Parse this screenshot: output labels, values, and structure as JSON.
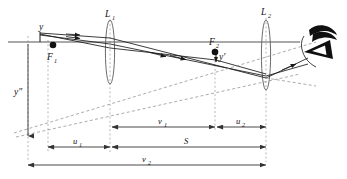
{
  "figure": {
    "type": "optical-ray-diagram",
    "title": "",
    "background_color": "#ffffff",
    "width": 347,
    "height": 179
  },
  "colors": {
    "ray": "#1a1a1a",
    "axis": "#555555",
    "lens_outline": "#6b6b6b",
    "dashed_guide": "#9a9a9a",
    "dimension": "#333333",
    "label": "#111111",
    "eye": "#101010"
  },
  "labels": {
    "lens1": "L",
    "lens1_sub": "1",
    "lens2": "L",
    "lens2_sub": "2",
    "focus1": "F",
    "focus1_sub": "1",
    "focus2": "F",
    "focus2_sub": "2",
    "object": "y",
    "image_prime": "y′",
    "image_double_prime": "y″",
    "dim_u1": "u",
    "dim_u1_sub": "1",
    "dim_u2": "u",
    "dim_u2_sub": "2",
    "dim_v1": "v",
    "dim_v1_sub": "1",
    "dim_v2": "v",
    "dim_v2_sub": "2",
    "dim_s": "S"
  },
  "elements": {
    "lenses": [
      {
        "name": "L1",
        "cx": 110,
        "cy": 52,
        "rx": 4.6,
        "ry": 32
      },
      {
        "name": "L2",
        "cx": 266,
        "cy": 55,
        "rx": 4.6,
        "ry": 35
      }
    ],
    "focal_points": [
      {
        "name": "F1",
        "cx": 53,
        "cy": 45,
        "r": 3.2
      },
      {
        "name": "F2",
        "cx": 215,
        "cy": 52,
        "r": 3.2
      }
    ],
    "optical_axis": {
      "x1": 8,
      "y1": 42,
      "x2": 300,
      "y2": 42
    },
    "eye": {
      "cx": 318,
      "cy": 45,
      "label": "observer-eye"
    }
  },
  "dimensions": [
    {
      "id": "u1",
      "label": "u",
      "sub": "1",
      "x1": 48,
      "x2": 110,
      "y": 147
    },
    {
      "id": "v1",
      "label": "v",
      "sub": "1",
      "x1": 112,
      "x2": 215,
      "y": 127
    },
    {
      "id": "u2",
      "label": "u",
      "sub": "2",
      "x1": 217,
      "x2": 266,
      "y": 127
    },
    {
      "id": "S",
      "label": "S",
      "sub": "",
      "x1": 112,
      "x2": 266,
      "y": 147
    },
    {
      "id": "v2",
      "label": "v",
      "sub": "2",
      "x1": 28,
      "x2": 266,
      "y": 165
    }
  ]
}
